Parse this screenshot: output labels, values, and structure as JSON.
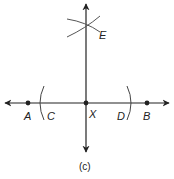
{
  "diagram": {
    "caption": "(c)",
    "points": {
      "A": "A",
      "B": "B",
      "C": "C",
      "D": "D",
      "X": "X",
      "E": "E"
    },
    "colors": {
      "stroke": "#222222",
      "background": "#ffffff"
    }
  }
}
